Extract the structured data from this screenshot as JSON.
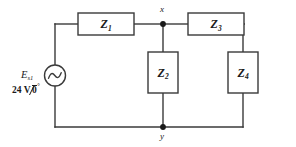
{
  "diagram": {
    "type": "ac-circuit-schematic",
    "stroke_color": "#3a3a3a",
    "label_color": "#1a1a1a",
    "background": "#ffffff"
  },
  "source": {
    "name": "E",
    "name_sub": "s1",
    "symbol": "ac-voltage-source",
    "magnitude": "24 V",
    "angle": "0",
    "degree_symbol": "°",
    "value_text": "24 V∠0°"
  },
  "components": [
    {
      "id": "z1",
      "label": "Z",
      "sub": "1",
      "orientation": "horizontal",
      "branch": "top-left-series",
      "x": 78,
      "y": 13,
      "w": 56,
      "h": 22
    },
    {
      "id": "z2",
      "label": "Z",
      "sub": "2",
      "orientation": "vertical",
      "branch": "shunt-at-node-x",
      "x": 148,
      "y": 52,
      "w": 30,
      "h": 41
    },
    {
      "id": "z3",
      "label": "Z",
      "sub": "3",
      "orientation": "horizontal",
      "branch": "top-right-series",
      "x": 188,
      "y": 13,
      "w": 56,
      "h": 22
    },
    {
      "id": "z4",
      "label": "Z",
      "sub": "4",
      "orientation": "vertical",
      "branch": "shunt-right",
      "x": 228,
      "y": 52,
      "w": 30,
      "h": 41
    }
  ],
  "nodes": [
    {
      "id": "x",
      "label": "x",
      "x": 163,
      "y": 24,
      "label_x": 160,
      "label_y": 9
    },
    {
      "id": "y",
      "label": "y",
      "x": 163,
      "y": 127,
      "label_x": 160,
      "label_y": 139
    }
  ]
}
